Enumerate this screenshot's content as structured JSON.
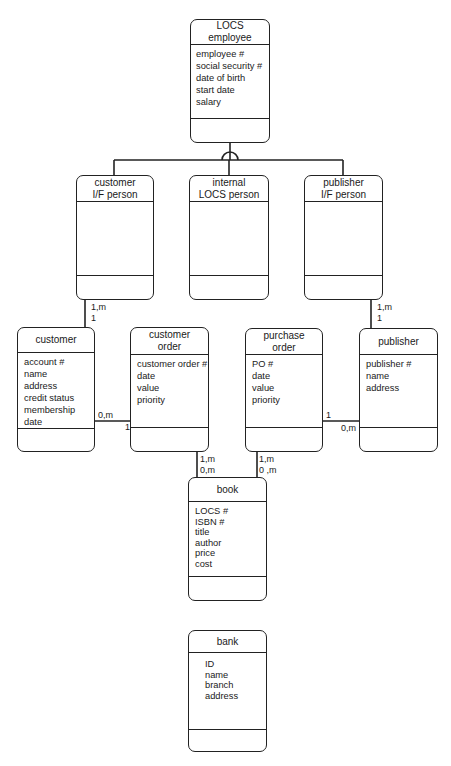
{
  "entities": {
    "locs_employee": {
      "title": [
        "LOCS",
        "employee"
      ],
      "attributes": [
        "employee #",
        "social security #",
        "date of birth",
        "start date",
        "salary"
      ]
    },
    "customer_if_person": {
      "title": [
        "customer",
        "I/F person"
      ],
      "attributes": []
    },
    "internal_locs_person": {
      "title": [
        "internal",
        "LOCS person"
      ],
      "attributes": []
    },
    "publisher_if_person": {
      "title": [
        "publisher",
        "I/F person"
      ],
      "attributes": []
    },
    "customer": {
      "title": [
        "customer"
      ],
      "attributes": [
        "account #",
        "name",
        "address",
        "credit status",
        "membership date"
      ]
    },
    "customer_order": {
      "title": [
        "customer",
        "order"
      ],
      "attributes": [
        "customer order #",
        "date",
        "value",
        "priority"
      ]
    },
    "purchase_order": {
      "title": [
        "purchase",
        "order"
      ],
      "attributes": [
        "PO #",
        "date",
        "value",
        "priority"
      ]
    },
    "publisher": {
      "title": [
        "publisher"
      ],
      "attributes": [
        "publisher #",
        "name",
        "address"
      ]
    },
    "book": {
      "title": [
        "book"
      ],
      "attributes": [
        "LOCS #",
        "ISBN #",
        "title",
        "author",
        "price",
        "cost"
      ]
    },
    "bank": {
      "title": [
        "bank"
      ],
      "attributes": [
        "ID",
        "name",
        "branch",
        "address"
      ]
    }
  },
  "relationships": [
    {
      "from": "customer_if_person",
      "to": "customer",
      "card_from": "1,m",
      "card_to": "1"
    },
    {
      "from": "publisher_if_person",
      "to": "publisher",
      "card_from": "1,m",
      "card_to": "1"
    },
    {
      "from": "customer",
      "to": "customer_order",
      "card_from": "0,m",
      "card_to": "1"
    },
    {
      "from": "purchase_order",
      "to": "publisher",
      "card_from": "1",
      "card_to": "0,m"
    },
    {
      "from": "customer_order",
      "to": "book",
      "card_from": "1,m",
      "card_to": "0,m"
    },
    {
      "from": "purchase_order",
      "to": "book",
      "card_from": "1,m",
      "card_to": "0 ,m"
    }
  ],
  "cardinalities": {
    "cifp_customer_top": "1,m",
    "cifp_customer_bottom": "1",
    "pifp_publisher_top": "1,m",
    "pifp_publisher_bottom": "1",
    "customer_side": "0,m",
    "customer_order_side": "1",
    "purchase_order_side": "1",
    "publisher_side": "0,m",
    "co_book_top": "1,m",
    "co_book_bottom": "0,m",
    "po_book_top": "1,m",
    "po_book_bottom": "0 ,m"
  }
}
